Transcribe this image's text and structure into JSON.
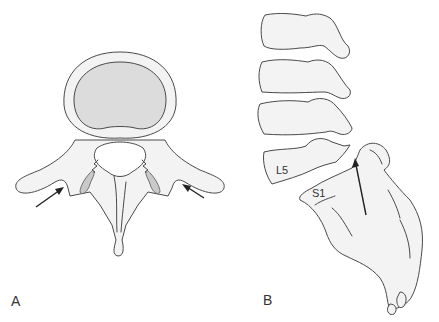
{
  "figure": {
    "panels": [
      {
        "id": "A",
        "label": "A",
        "view": "axial vertebra",
        "arrows": 2
      },
      {
        "id": "B",
        "label": "B",
        "view": "lateral lumbosacral spine",
        "arrows": 1,
        "bone_labels": [
          "L5",
          "S1"
        ]
      }
    ]
  },
  "labels": {
    "panel_a": "A",
    "panel_b": "B",
    "l5": "L5",
    "s1": "S1"
  },
  "colors": {
    "bone_fill": "#f3f3f3",
    "body_fill": "#dcdcdc",
    "outline": "#4a4a4a",
    "arrow": "#222222"
  }
}
